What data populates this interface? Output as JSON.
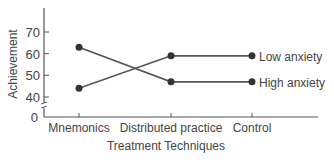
{
  "chart_data": {
    "type": "line",
    "title": "",
    "xlabel": "Treatment Techniques",
    "ylabel": "Achievement",
    "categories": [
      "Mnemonics",
      "Distributed practice",
      "Control"
    ],
    "series": [
      {
        "name": "Low anxiety",
        "values": [
          44,
          59,
          59
        ]
      },
      {
        "name": "High anxiety",
        "values": [
          63,
          47,
          47
        ]
      }
    ],
    "yticks": [
      0,
      40,
      50,
      60,
      70
    ],
    "ylim": [
      0,
      80
    ],
    "axis_break": true,
    "grid": false,
    "legend_position": "inline-right"
  },
  "colors": {
    "line": "#555555",
    "marker": "#333333",
    "text": "#444444",
    "background": "#ffffff"
  }
}
